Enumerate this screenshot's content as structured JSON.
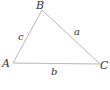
{
  "diagram": {
    "type": "triangle",
    "line_color": "#b8b8b8",
    "label_color": "#333333",
    "vertices": [
      {
        "name": "A",
        "x": 13,
        "y": 63
      },
      {
        "name": "B",
        "x": 42,
        "y": 10
      },
      {
        "name": "C",
        "x": 100,
        "y": 64
      }
    ],
    "sides": [
      {
        "name": "c",
        "between": [
          "A",
          "B"
        ]
      },
      {
        "name": "a",
        "between": [
          "B",
          "C"
        ]
      },
      {
        "name": "b",
        "between": [
          "A",
          "C"
        ]
      }
    ],
    "labels": {
      "A": "A",
      "B": "B",
      "C": "C",
      "a": "a",
      "b": "b",
      "c": "c"
    }
  }
}
